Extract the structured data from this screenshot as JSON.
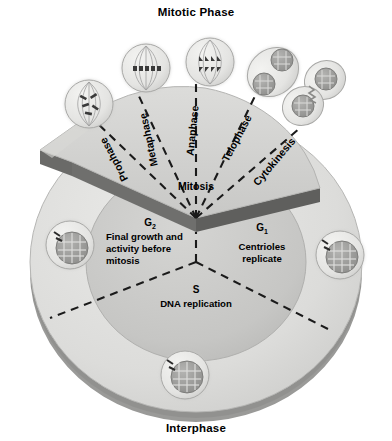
{
  "figure": {
    "kind": "cell-cycle-diagram",
    "top_title": "Mitotic Phase",
    "bottom_title": "Interphase",
    "mitosis_label": "Mitosis"
  },
  "colors": {
    "disc_outer": "#dededc",
    "disc_inner": "#c9c9c7",
    "wedge": "#d3d3d1",
    "rim_shadow": "#8e8e8c",
    "edge_dark": "#6e6e6c",
    "cell_body": "#e8e8e6",
    "nucleus": "#9a9a98",
    "dashed": "#1a1a1a",
    "text": "#111111"
  },
  "mitotic_phase": {
    "label": "Mitotic Phase",
    "stages": [
      {
        "name": "Prophase",
        "angle": -68,
        "label_r": 128
      },
      {
        "name": "Metaphase",
        "angle": -42,
        "label_r": 128
      },
      {
        "name": "Anaphase",
        "angle": -14,
        "label_r": 128
      },
      {
        "name": "Telophase",
        "angle": 14,
        "label_r": 128
      },
      {
        "name": "Cytokinesis",
        "angle": 44,
        "label_r": 128
      }
    ]
  },
  "interphase": {
    "label": "Interphase",
    "phases": [
      {
        "key": "G2",
        "symbol": "G",
        "subscript": "2",
        "description": "Final growth and activity before mitosis"
      },
      {
        "key": "G1",
        "symbol": "G",
        "subscript": "1",
        "description": "Centrioles replicate"
      },
      {
        "key": "S",
        "symbol": "S",
        "subscript": "",
        "description": "DNA replication"
      }
    ]
  },
  "cells": [
    {
      "name": "prophase-cell",
      "type": "spindle-condensed",
      "cx": 89,
      "cy": 104
    },
    {
      "name": "metaphase-cell",
      "type": "spindle-aligned",
      "cx": 146,
      "cy": 68
    },
    {
      "name": "anaphase-cell",
      "type": "spindle-separated",
      "cx": 210,
      "cy": 62
    },
    {
      "name": "telophase-cell",
      "type": "two-nuclei",
      "cx": 273,
      "cy": 72
    },
    {
      "name": "cytokinesis-cell",
      "type": "cleaving",
      "cx": 316,
      "cy": 92
    },
    {
      "name": "g2-interphase-cell",
      "type": "interphase",
      "cx": 70,
      "cy": 245
    },
    {
      "name": "g1-interphase-cell",
      "type": "interphase",
      "cx": 340,
      "cy": 255
    },
    {
      "name": "s-interphase-cell",
      "type": "interphase",
      "cx": 185,
      "cy": 375
    }
  ]
}
